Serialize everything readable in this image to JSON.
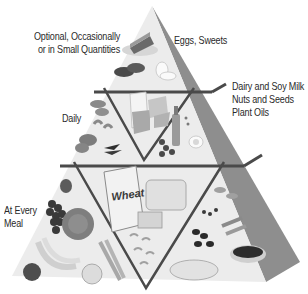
{
  "diagram": {
    "tiers": [
      {
        "name": "optional",
        "frequency_label": "Optional, Occasionally\nor in Small Quantities",
        "frequency_lines": [
          "Optional, Occasionally",
          "or in Small Quantities"
        ],
        "foods_label": "Eggs, Sweets",
        "foods_icons": [
          "cake-slice",
          "meat-cuts",
          "egg"
        ]
      },
      {
        "name": "daily",
        "frequency_label": "Daily",
        "foods_label": "Dairy and Soy Milk\nNuts and Seeds\nPlant Oils",
        "foods_lines": [
          "Dairy and Soy Milk",
          "Nuts and Seeds",
          "Plant Oils"
        ],
        "foods_icons": [
          "nuts",
          "milk-carton",
          "cheese",
          "oil-bottle",
          "olives",
          "egg"
        ]
      },
      {
        "name": "every-meal",
        "frequency_label": "At Every\nMeal",
        "frequency_lines": [
          "At Every",
          "Meal"
        ],
        "foods_icons": [
          "strawberry",
          "grapes",
          "cabbage",
          "bananas",
          "apple",
          "peach",
          "carrots",
          "wheat-cereal-box",
          "bread-loaf",
          "pasta",
          "beans",
          "rice-bowl",
          "tortilla-plate",
          "legumes"
        ]
      }
    ],
    "cereal_box_text": "Wheat",
    "colors": {
      "face": "#e9e9e9",
      "side": "#8c8c8c",
      "lines": "#4a4a4a",
      "text": "#2a2a2a"
    }
  }
}
